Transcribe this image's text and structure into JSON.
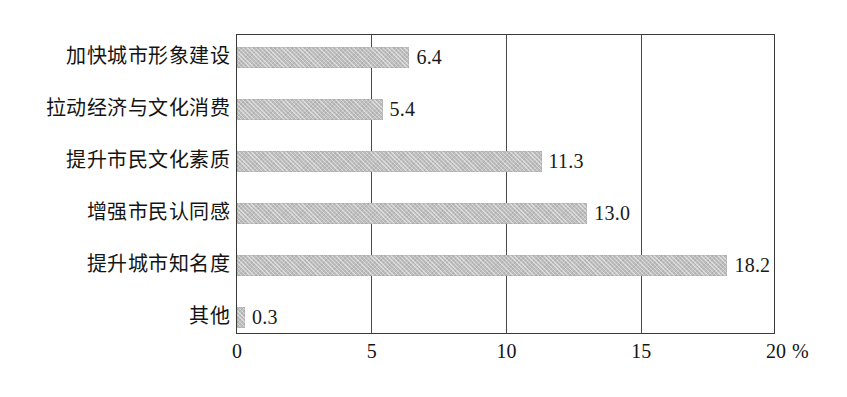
{
  "chart_data": {
    "type": "bar",
    "orientation": "horizontal",
    "title": "",
    "xlabel": "%",
    "ylabel": "",
    "xlim": [
      0,
      20
    ],
    "grid": true,
    "legend": null,
    "axis_unit": "%",
    "x_ticks": [
      "0",
      "5",
      "10",
      "15",
      "20"
    ],
    "x_tick_values": [
      0,
      5,
      10,
      15,
      20
    ],
    "categories": [
      "加快城市形象建设",
      "拉动经济与文化消费",
      "提升市民文化素质",
      "增强市民认同感",
      "提升城市知名度",
      "其他"
    ],
    "values": [
      6.4,
      5.4,
      11.3,
      13.0,
      18.2,
      0.3
    ],
    "value_labels": [
      "6.4",
      "5.4",
      "11.3",
      "13.0",
      "18.2",
      "0.3"
    ],
    "bar_color": "#bfbfbf",
    "frame_color": "#3a3a3a",
    "text_color": "#141414"
  }
}
